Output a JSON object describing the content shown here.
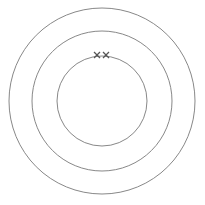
{
  "diagram": {
    "type": "electron-shell-diagram",
    "width": 205,
    "height": 205,
    "center": {
      "x": 102,
      "y": 101
    },
    "stroke_color": "#888888",
    "marker_color": "#555555",
    "shells": [
      {
        "name": "shell-1",
        "radius": 45,
        "electrons": 2
      },
      {
        "name": "shell-2",
        "radius": 70,
        "electrons": 0
      },
      {
        "name": "shell-3",
        "radius": 93,
        "electrons": 0
      }
    ],
    "electrons": [
      {
        "shell": 1,
        "x": 97,
        "y": 55,
        "symbol": "×"
      },
      {
        "shell": 1,
        "x": 106,
        "y": 55,
        "symbol": "×"
      }
    ]
  }
}
